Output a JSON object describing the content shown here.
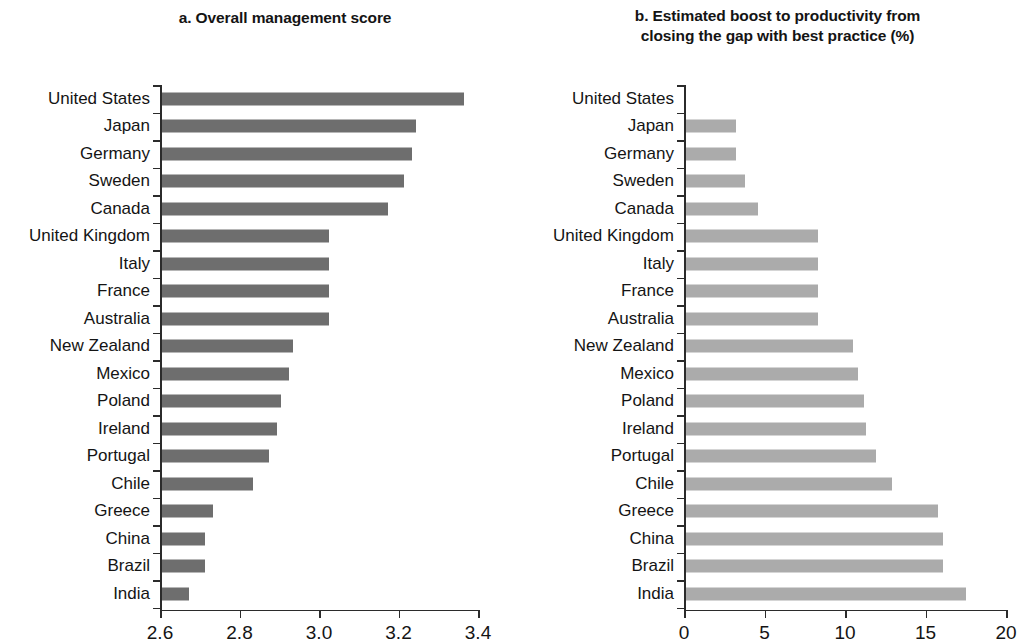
{
  "figure": {
    "background": "#ffffff",
    "bar_color_a": "#6e6e6e",
    "bar_color_b": "#ababab",
    "axis_color": "#2b2b2b"
  },
  "panel_a": {
    "title": "a. Overall management score",
    "title_lines": [
      "a. Overall management score"
    ]
  },
  "panel_b": {
    "title": "b. Estimated boost to productivity from closing the gap with best practice (%)",
    "title_lines": [
      "b. Estimated boost to productivity from",
      "closing the gap with best practice (%)"
    ]
  },
  "chart_data": [
    {
      "type": "bar",
      "orientation": "horizontal",
      "title": "a. Overall management score",
      "xlabel": "",
      "ylabel": "",
      "xlim": [
        2.6,
        3.4
      ],
      "xticks": [
        2.6,
        2.8,
        3.0,
        3.2,
        3.4
      ],
      "xtick_labels": [
        "2.6",
        "2.8",
        "3.0",
        "3.2",
        "3.4"
      ],
      "grid": false,
      "legend": "none",
      "bar_color": "#6e6e6e",
      "categories": [
        "United States",
        "Japan",
        "Germany",
        "Sweden",
        "Canada",
        "United Kingdom",
        "Italy",
        "France",
        "Australia",
        "New Zealand",
        "Mexico",
        "Poland",
        "Ireland",
        "Portugal",
        "Chile",
        "Greece",
        "China",
        "Brazil",
        "India"
      ],
      "values": [
        3.36,
        3.24,
        3.23,
        3.21,
        3.17,
        3.02,
        3.02,
        3.02,
        3.02,
        2.93,
        2.92,
        2.9,
        2.89,
        2.87,
        2.83,
        2.73,
        2.71,
        2.71,
        2.67
      ]
    },
    {
      "type": "bar",
      "orientation": "horizontal",
      "title": "b. Estimated boost to productivity from closing the gap with best practice (%)",
      "xlabel": "",
      "ylabel": "",
      "xlim": [
        0,
        20
      ],
      "xticks": [
        0,
        5,
        10,
        15,
        20
      ],
      "xtick_labels": [
        "0",
        "5",
        "10",
        "15",
        "20"
      ],
      "grid": false,
      "legend": "none",
      "bar_color": "#ababab",
      "categories": [
        "United States",
        "Japan",
        "Germany",
        "Sweden",
        "Canada",
        "United Kingdom",
        "Italy",
        "France",
        "Australia",
        "New Zealand",
        "Mexico",
        "Poland",
        "Ireland",
        "Portugal",
        "Chile",
        "Greece",
        "China",
        "Brazil",
        "India"
      ],
      "values": [
        0.0,
        3.1,
        3.1,
        3.7,
        4.5,
        8.2,
        8.2,
        8.2,
        8.2,
        10.4,
        10.7,
        11.1,
        11.2,
        11.8,
        12.8,
        15.7,
        16.0,
        16.0,
        17.4
      ]
    }
  ]
}
